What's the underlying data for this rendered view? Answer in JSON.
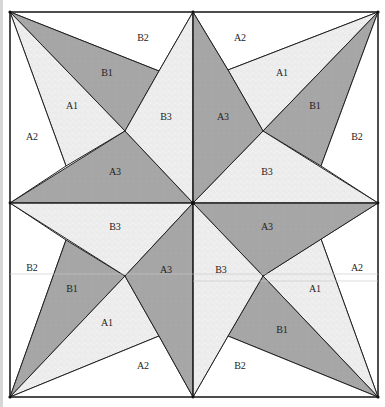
{
  "diagram": {
    "type": "quilt-block",
    "colors": {
      "dark": "#a6a6a6",
      "light": "#ececec",
      "white": "#ffffff",
      "line": "#222222",
      "background": "#ffffff"
    },
    "quadrants": [
      {
        "name": "top-left",
        "labels": {
          "B2": "B2",
          "B1": "B1",
          "A1": "A1",
          "A2": "A2",
          "A3": "A3",
          "B3": "B3"
        }
      },
      {
        "name": "top-right",
        "labels": {
          "A2": "A2",
          "A1": "A1",
          "A3": "A3",
          "B1": "B1",
          "B2": "B2",
          "B3": "B3"
        }
      },
      {
        "name": "bottom-left",
        "labels": {
          "B3": "B3",
          "B2": "B2",
          "B1": "B1",
          "A3": "A3",
          "A1": "A1",
          "A2": "A2"
        }
      },
      {
        "name": "bottom-right",
        "labels": {
          "A3": "A3",
          "B3": "B3",
          "A2": "A2",
          "A1": "A1",
          "B1": "B1",
          "B2": "B2"
        }
      }
    ]
  }
}
